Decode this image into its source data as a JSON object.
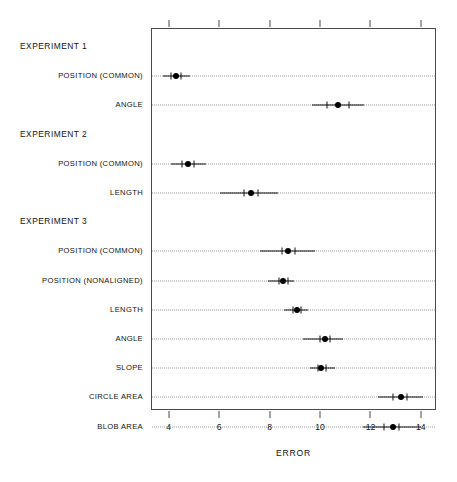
{
  "chart_data": {
    "type": "scatter",
    "title": "",
    "subtitle": "",
    "xlabel": "ERROR",
    "ylabel": "",
    "xlim": [
      3.3,
      14.6
    ],
    "ylim": [
      0,
      13
    ],
    "grid": true,
    "legend": null,
    "orientation": "horizontal",
    "xticks": [
      4,
      6,
      8,
      10,
      12,
      14
    ],
    "xticklabels": [
      "4",
      "6",
      "8",
      "10",
      "12",
      "14"
    ],
    "groups": [
      {
        "name": "EXPERIMENT 1",
        "rows": [
          {
            "label": "POSITION (COMMON)",
            "value": 4.24,
            "inner_low": 4.05,
            "inner_high": 4.45,
            "outer_low": 3.75,
            "outer_high": 4.8
          },
          {
            "label": "ANGLE",
            "value": 10.69,
            "inner_low": 10.25,
            "inner_high": 11.1,
            "outer_low": 9.65,
            "outer_high": 11.72
          }
        ]
      },
      {
        "name": "EXPERIMENT 2",
        "rows": [
          {
            "label": "POSITION (COMMON)",
            "value": 4.72,
            "inner_low": 4.5,
            "inner_high": 4.95,
            "outer_low": 4.05,
            "outer_high": 5.45
          },
          {
            "label": "LENGTH",
            "value": 7.23,
            "inner_low": 6.95,
            "inner_high": 7.5,
            "outer_low": 6.0,
            "outer_high": 8.3
          }
        ]
      },
      {
        "name": "EXPERIMENT 3",
        "rows": [
          {
            "label": "POSITION (COMMON)",
            "value": 8.71,
            "inner_low": 8.45,
            "inner_high": 8.95,
            "outer_low": 7.6,
            "outer_high": 9.75
          },
          {
            "label": "POSITION (NONALIGNED)",
            "value": 8.5,
            "inner_low": 8.35,
            "inner_high": 8.68,
            "outer_low": 7.9,
            "outer_high": 8.95
          },
          {
            "label": "LENGTH",
            "value": 9.06,
            "inner_low": 8.9,
            "inner_high": 9.22,
            "outer_low": 8.55,
            "outer_high": 9.48
          },
          {
            "label": "ANGLE",
            "value": 10.14,
            "inner_low": 9.95,
            "inner_high": 10.35,
            "outer_low": 9.3,
            "outer_high": 10.88
          },
          {
            "label": "SLOPE",
            "value": 10.02,
            "inner_low": 9.88,
            "inner_high": 10.2,
            "outer_low": 9.55,
            "outer_high": 10.55
          },
          {
            "label": "CIRCLE AREA",
            "value": 13.16,
            "inner_low": 12.85,
            "inner_high": 13.4,
            "outer_low": 12.25,
            "outer_high": 14.05
          },
          {
            "label": "BLOB AREA",
            "value": 12.84,
            "inner_low": 12.5,
            "inner_high": 13.1,
            "outer_low": 11.65,
            "outer_high": 13.95
          }
        ]
      }
    ],
    "colors": {
      "dot": "#000000",
      "interval": "#111111",
      "grid": "#9a9a9a",
      "frame": "#4a4a4a",
      "text": "#111111",
      "background": "#ffffff"
    }
  }
}
